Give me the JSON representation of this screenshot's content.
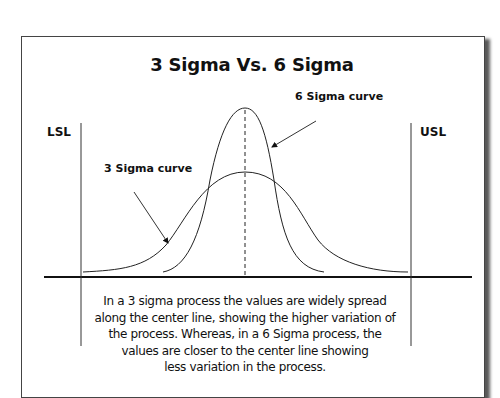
{
  "title": "3 Sigma Vs. 6 Sigma",
  "limits": {
    "lower_label": "LSL",
    "upper_label": "USL"
  },
  "curves": {
    "three_sigma_label": "3 Sigma curve",
    "six_sigma_label": "6 Sigma curve"
  },
  "caption": "In a 3 sigma process the values are widely spread along the center line, showing the higher variation of the process. Whereas, in a 6 Sigma process, the values are closer to the center line showing less variation in the process.",
  "caption_lines": [
    "In a 3 sigma process the values are widely spread",
    "along the center line, showing the higher variation of",
    "the process. Whereas, in a 6 Sigma process, the",
    "values are closer to the center line showing",
    "less variation in the process."
  ],
  "colors": {
    "line": "#111111",
    "curve": "#222222",
    "border": "#444444"
  }
}
